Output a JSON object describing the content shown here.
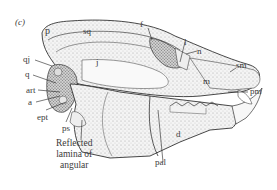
{
  "figure": {
    "panel_label": "(c)",
    "labels": {
      "p": "p",
      "sq": "sq",
      "f": "f",
      "l": "l",
      "n": "n",
      "sm": "sm",
      "qj": "qj",
      "q": "q",
      "j": "j",
      "m": "m",
      "pm": "pm",
      "art": "art",
      "a": "a",
      "ept": "ept",
      "ps": "ps",
      "d": "d",
      "pal": "pal"
    },
    "caption_lines": [
      "Reflected",
      "lamina of",
      "angular"
    ]
  }
}
